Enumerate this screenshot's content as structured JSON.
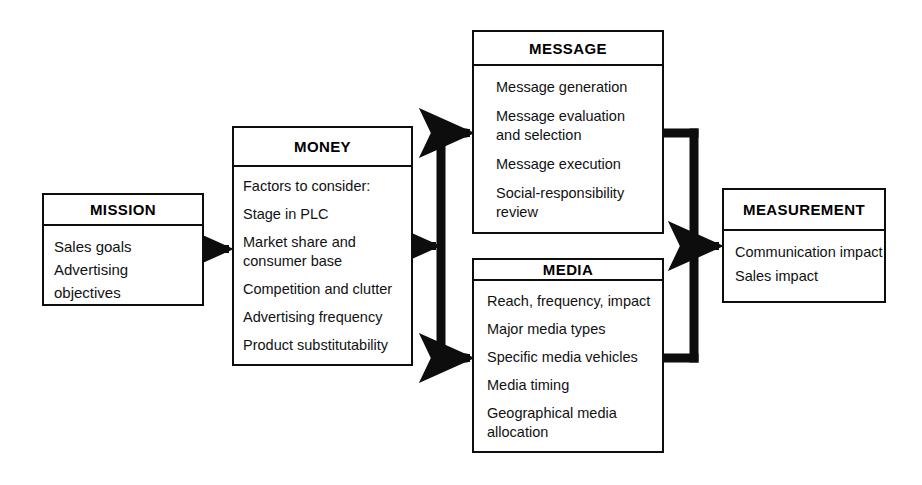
{
  "diagram": {
    "nodes": [
      {
        "id": "mission",
        "header": "MISSION",
        "items": [
          "Sales goals",
          "Advertising objectives"
        ]
      },
      {
        "id": "money",
        "header": "MONEY",
        "items": [
          "Factors to consider:",
          "Stage in PLC",
          "Market share and\nconsumer base",
          "Competition and clutter",
          "Advertising frequency",
          "Product substitutability"
        ]
      },
      {
        "id": "message",
        "header": "MESSAGE",
        "items": [
          "Message generation",
          "Message evaluation\nand selection",
          "Message execution",
          "Social-responsibility\nreview"
        ]
      },
      {
        "id": "media",
        "header": "MEDIA",
        "items": [
          "Reach, frequency, impact",
          "Major media types",
          "Specific media vehicles",
          "Media timing",
          "Geographical media\nallocation"
        ]
      },
      {
        "id": "measurement",
        "header": "MEASUREMENT",
        "items": [
          "Communication impact",
          "Sales impact"
        ]
      }
    ],
    "connectors": [
      {
        "id": "mission-to-money",
        "from": "mission",
        "to": "money",
        "kind": "arrow"
      },
      {
        "id": "money-to-split",
        "from": "money",
        "to": "split-bracket",
        "kind": "arrow"
      },
      {
        "id": "split-to-message",
        "from": "split-bracket",
        "to": "message",
        "kind": "arrow"
      },
      {
        "id": "split-to-media",
        "from": "split-bracket",
        "to": "media",
        "kind": "arrow"
      },
      {
        "id": "message-to-merge",
        "from": "message",
        "to": "merge-bracket",
        "kind": "line"
      },
      {
        "id": "media-to-merge",
        "from": "media",
        "to": "merge-bracket",
        "kind": "line"
      },
      {
        "id": "merge-to-measurement",
        "from": "merge-bracket",
        "to": "measurement",
        "kind": "arrow"
      }
    ],
    "colors": {
      "stroke": "#0d0d0d",
      "background": "#ffffff",
      "text": "#111111"
    }
  }
}
